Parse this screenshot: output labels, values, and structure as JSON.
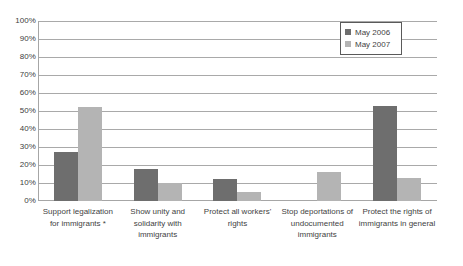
{
  "chart_data": {
    "type": "bar",
    "title": "",
    "subtitle": "",
    "xlabel": "",
    "ylabel": "",
    "ylim": [
      0,
      100
    ],
    "ytick_labels": [
      "100%",
      "90%",
      "80%",
      "70%",
      "60%",
      "50%",
      "40%",
      "30%",
      "20%",
      "10%",
      "0%"
    ],
    "ytick_values": [
      100,
      90,
      80,
      70,
      60,
      50,
      40,
      30,
      20,
      10,
      0
    ],
    "grid": "horizontal",
    "legend_position": "top-right",
    "categories": [
      "Support legalization for immigrants *",
      "Show unity and solidarity with immigrants",
      "Protect all workers' rights",
      "Stop deportations of undocumented immigrants",
      "Protect the rights of immigrants in general"
    ],
    "series": [
      {
        "name": "May 2006",
        "color": "#6e6e6e",
        "values": [
          27,
          18,
          12,
          0,
          53
        ]
      },
      {
        "name": "May 2007",
        "color": "#b4b4b4",
        "values": [
          52,
          10,
          5,
          16,
          13
        ]
      }
    ]
  },
  "legend": {
    "items": [
      {
        "label": "May 2006",
        "color": "#6e6e6e"
      },
      {
        "label": "May 2007",
        "color": "#b4b4b4"
      }
    ]
  },
  "axis": {
    "y_labels": [
      "100%",
      "90%",
      "80%",
      "70%",
      "60%",
      "50%",
      "40%",
      "30%",
      "20%",
      "10%",
      "0%"
    ],
    "x_labels": [
      "Support legalization for immigrants *",
      "Show unity and solidarity with immigrants",
      "Protect all workers' rights",
      "Stop deportations of undocumented immigrants",
      "Protect the rights of immigrants in general"
    ]
  },
  "colors": {
    "series_2006": "#6e6e6e",
    "series_2007": "#b4b4b4",
    "gridline": "#a9a9a9",
    "axis": "#a6a6a6",
    "text": "#3f3f3f",
    "background": "#ffffff"
  }
}
